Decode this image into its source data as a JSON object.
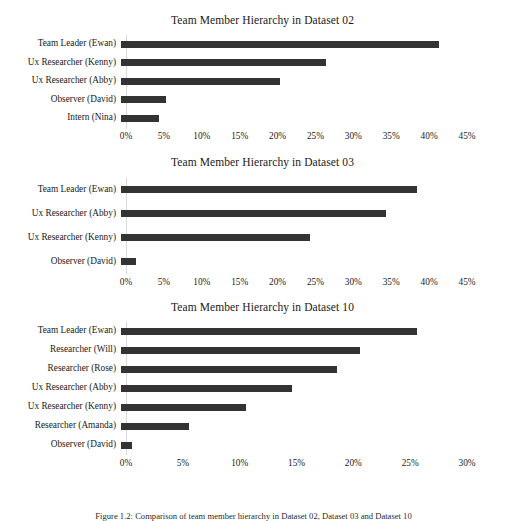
{
  "page": {
    "background_color": "#ffffff",
    "bar_color": "#333333",
    "axis_line_color": "#d9d9d9",
    "text_color": "#1a1a1a",
    "caption": "Figure 1.2: Comparison of team member hierarchy in Dataset 02, Dataset 03 and Dataset 10"
  },
  "chart_data": [
    {
      "type": "bar",
      "orientation": "horizontal",
      "title": "Team Member Hierarchy in Dataset 02",
      "xlabel": "",
      "ylabel": "",
      "grid": false,
      "legend": "none",
      "xlim": [
        0,
        45
      ],
      "xticks": [
        "0%",
        "5%",
        "10%",
        "15%",
        "20%",
        "25%",
        "30%",
        "35%",
        "40%",
        "45%"
      ],
      "xtick_values": [
        0,
        5,
        10,
        15,
        20,
        25,
        30,
        35,
        40,
        45
      ],
      "unit": "%",
      "categories": [
        "Team Leader (Ewan)",
        "Ux Researcher (Kenny)",
        "Ux Researcher (Abby)",
        "Observer (David)",
        "Intern (Nina)"
      ],
      "values": [
        42,
        27,
        21,
        6,
        5
      ]
    },
    {
      "type": "bar",
      "orientation": "horizontal",
      "title": "Team Member Hierarchy in Dataset 03",
      "xlabel": "",
      "ylabel": "",
      "grid": false,
      "legend": "none",
      "xlim": [
        0,
        45
      ],
      "xticks": [
        "0%",
        "5%",
        "10%",
        "15%",
        "20%",
        "25%",
        "30%",
        "35%",
        "40%",
        "45%"
      ],
      "xtick_values": [
        0,
        5,
        10,
        15,
        20,
        25,
        30,
        35,
        40,
        45
      ],
      "unit": "%",
      "categories": [
        "Team Leader (Ewan)",
        "Ux Researcher (Abby)",
        "Ux Researcher (Kenny)",
        "Observer (David)"
      ],
      "values": [
        39,
        35,
        25,
        2
      ]
    },
    {
      "type": "bar",
      "orientation": "horizontal",
      "title": "Team Member Hierarchy in Dataset 10",
      "xlabel": "",
      "ylabel": "",
      "grid": false,
      "legend": "none",
      "xlim": [
        0,
        30
      ],
      "xticks": [
        "0%",
        "5%",
        "10%",
        "15%",
        "20%",
        "25%",
        "30%"
      ],
      "xtick_values": [
        0,
        5,
        10,
        15,
        20,
        25,
        30
      ],
      "unit": "%",
      "categories": [
        "Team Leader (Ewan)",
        "Researcher (Will)",
        "Researcher (Rose)",
        "Ux Researcher (Abby)",
        "Ux Researcher (Kenny)",
        "Researcher (Amanda)",
        "Observer (David)"
      ],
      "values": [
        26,
        21,
        19,
        15,
        11,
        6,
        1
      ]
    }
  ]
}
